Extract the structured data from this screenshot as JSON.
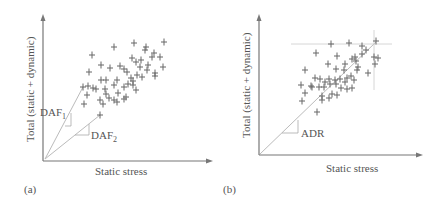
{
  "colors": {
    "axis": "#777777",
    "marker": "#666666",
    "guide": "#bbbbbb",
    "text": "#555555"
  },
  "panels": [
    {
      "id": "a",
      "label": "(a)",
      "xlabel": "Static stress",
      "ylabel": "Total (static + dynamic)",
      "annotations": [
        {
          "text": "DAF",
          "sub": "1"
        },
        {
          "text": "DAF",
          "sub": "2"
        }
      ]
    },
    {
      "id": "b",
      "label": "(b)",
      "xlabel": "Static stress",
      "ylabel": "Total (static + dynamic)",
      "annotations": [
        {
          "text": "ADR"
        }
      ]
    }
  ],
  "chart_data": [
    {
      "type": "scatter",
      "title": "",
      "xlabel": "Static stress",
      "ylabel": "Total (static + dynamic)",
      "marker": "+",
      "grid": false,
      "notes": "Scatter cloud of stress points; lines from origin through lowest-slope and highest-slope points labeled DAF1 (steep) and DAF2 (shallow)."
    },
    {
      "type": "scatter",
      "title": "",
      "xlabel": "Static stress",
      "ylabel": "Total (static + dynamic)",
      "marker": "+",
      "grid": false,
      "notes": "Scatter cloud with line from origin to maximum point labeled ADR; horizontal and vertical guide lines through max point."
    }
  ]
}
